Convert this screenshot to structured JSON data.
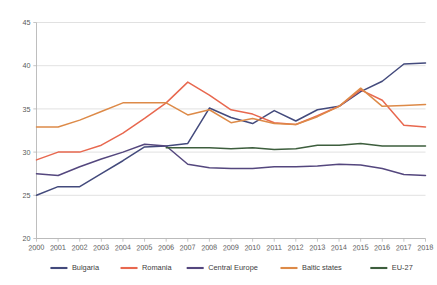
{
  "chart_data": {
    "type": "line",
    "title": "",
    "xlabel": "",
    "ylabel": "",
    "grid": "horizontal",
    "legend_position": "bottom",
    "ylim": [
      20,
      45
    ],
    "yticks": [
      20,
      25,
      30,
      35,
      40,
      45
    ],
    "categories": [
      "2000",
      "2001",
      "2002",
      "2003",
      "2004",
      "2005",
      "2006",
      "2007",
      "2008",
      "2009",
      "2010",
      "2011",
      "2012",
      "2013",
      "2014",
      "2015",
      "2016",
      "2017",
      "2018"
    ],
    "series": [
      {
        "name": "Bulgaria",
        "color": "#434a7c",
        "values": [
          25.0,
          26.0,
          26.0,
          27.5,
          29.0,
          30.6,
          30.7,
          31.0,
          35.1,
          34.0,
          33.3,
          34.8,
          33.6,
          34.9,
          35.3,
          37.0,
          38.2,
          40.2,
          40.3
        ]
      },
      {
        "name": "Romania",
        "color": "#e8684f",
        "values": [
          29.1,
          30.0,
          30.0,
          30.8,
          32.2,
          33.9,
          35.7,
          38.1,
          36.6,
          34.9,
          34.4,
          33.4,
          33.2,
          34.2,
          35.3,
          37.2,
          36.0,
          33.1,
          32.9
        ]
      },
      {
        "name": "Central Europe",
        "color": "#54477e",
        "values": [
          27.5,
          27.3,
          28.3,
          29.2,
          30.0,
          30.9,
          30.7,
          28.6,
          28.2,
          28.1,
          28.1,
          28.3,
          28.3,
          28.4,
          28.6,
          28.5,
          28.1,
          27.4,
          27.3
        ]
      },
      {
        "name": "Baltic states",
        "color": "#dd8a48",
        "values": [
          32.9,
          32.9,
          33.7,
          34.7,
          35.7,
          35.7,
          35.7,
          34.3,
          34.9,
          33.4,
          33.9,
          33.3,
          33.2,
          34.1,
          35.3,
          37.4,
          35.3,
          35.4,
          35.5
        ]
      },
      {
        "name": "EU-27",
        "color": "#3d5e3d",
        "start_index": 6,
        "values": [
          null,
          null,
          null,
          null,
          null,
          null,
          30.5,
          30.5,
          30.5,
          30.4,
          30.5,
          30.3,
          30.4,
          30.8,
          30.8,
          31.0,
          30.7,
          30.7,
          30.7
        ]
      }
    ]
  },
  "legend": {
    "items": [
      {
        "label": "Bulgaria"
      },
      {
        "label": "Romania"
      },
      {
        "label": "Central Europe"
      },
      {
        "label": "Baltic states"
      },
      {
        "label": "EU-27"
      }
    ]
  }
}
